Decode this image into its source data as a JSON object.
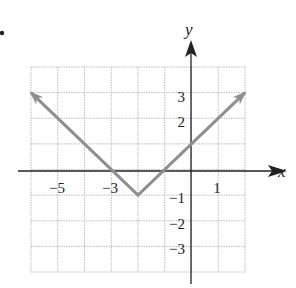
{
  "chart_data": {
    "type": "line",
    "title": "",
    "function": "y = |x + 2| - 1",
    "xlabel": "x",
    "ylabel": "y",
    "xlim": [
      -6,
      2
    ],
    "ylim": [
      -4,
      4
    ],
    "grid": true,
    "x_tick_labels": [
      "-5",
      "-3",
      "1"
    ],
    "y_tick_labels": [
      "3",
      "2",
      "-1",
      "-2",
      "-3"
    ],
    "series": [
      {
        "name": "graph",
        "color": "#8f8f8f",
        "points": [
          [
            -6,
            3
          ],
          [
            -2,
            -1
          ],
          [
            2,
            3
          ]
        ],
        "arrows_at_ends": true
      }
    ],
    "vertex": [
      -2,
      -1
    ],
    "x_intercepts": [
      -3,
      -1
    ],
    "y_intercept": 1
  },
  "labels": {
    "x_axis": "x",
    "y_axis": "y",
    "ticks_x": [
      {
        "text": "−5",
        "value": -5
      },
      {
        "text": "−3",
        "value": -3
      },
      {
        "text": "1",
        "value": 1
      }
    ],
    "ticks_y": [
      {
        "text": "3",
        "value": 3
      },
      {
        "text": "2",
        "value": 2
      },
      {
        "text": "−1",
        "value": -1
      },
      {
        "text": "−2",
        "value": -2
      },
      {
        "text": "−3",
        "value": -3
      }
    ]
  },
  "colors": {
    "grid": "#bdbdbd",
    "axis": "#222222",
    "curve": "#8f8f8f"
  }
}
